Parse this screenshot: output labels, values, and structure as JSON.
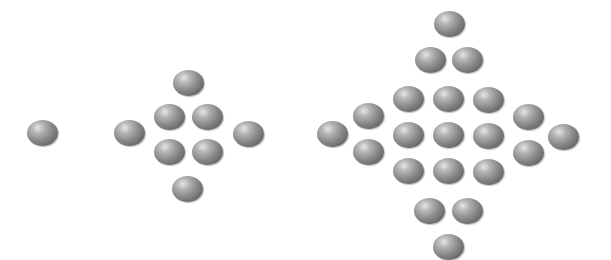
{
  "figure": {
    "background": "#ffffff",
    "sphere_color": "#8a8a8a"
  },
  "patterns": [
    {
      "name": "pattern-1",
      "count": 1,
      "balls": [
        [
          42,
          133
        ]
      ]
    },
    {
      "name": "pattern-2",
      "count": 9,
      "balls": [
        [
          188,
          83
        ],
        [
          169,
          117
        ],
        [
          207,
          117
        ],
        [
          129,
          133
        ],
        [
          248,
          134
        ],
        [
          169,
          152
        ],
        [
          207,
          152
        ],
        [
          187,
          189
        ]
      ]
    },
    {
      "name": "pattern-3",
      "count": 25,
      "balls": [
        [
          449,
          24
        ],
        [
          430,
          60
        ],
        [
          467,
          60
        ],
        [
          408,
          99
        ],
        [
          448,
          99
        ],
        [
          488,
          100
        ],
        [
          368,
          116
        ],
        [
          528,
          117
        ],
        [
          332,
          134
        ],
        [
          563,
          137
        ],
        [
          408,
          135
        ],
        [
          448,
          135
        ],
        [
          488,
          136
        ],
        [
          368,
          152
        ],
        [
          528,
          153
        ],
        [
          408,
          171
        ],
        [
          448,
          171
        ],
        [
          488,
          172
        ],
        [
          429,
          211
        ],
        [
          467,
          211
        ],
        [
          448,
          247
        ]
      ]
    }
  ]
}
